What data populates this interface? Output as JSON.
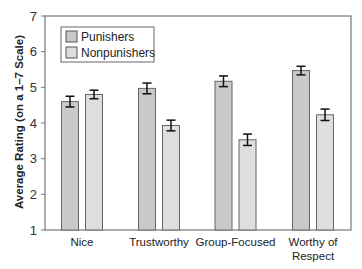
{
  "chart_data": {
    "type": "bar",
    "title": "",
    "xlabel": "",
    "ylabel": "Average Rating (on a 1–7 Scale)",
    "ylim": [
      1,
      7
    ],
    "yticks": [
      1,
      2,
      3,
      4,
      5,
      6,
      7
    ],
    "grid": false,
    "legend_position": "upper-left",
    "categories": [
      "Nice",
      "Trustworthy",
      "Group-Focused",
      "Worthy of Respect"
    ],
    "category_lines": [
      [
        "Nice"
      ],
      [
        "Trustworthy"
      ],
      [
        "Group-Focused"
      ],
      [
        "Worthy of",
        "Respect"
      ]
    ],
    "series": [
      {
        "name": "Punishers",
        "color": "#c9c9c9",
        "values": [
          4.6,
          4.97,
          5.17,
          5.47
        ],
        "errors": [
          0.15,
          0.15,
          0.15,
          0.12
        ]
      },
      {
        "name": "Nonpunishers",
        "color": "#dedede",
        "values": [
          4.8,
          3.93,
          3.53,
          4.23
        ],
        "errors": [
          0.12,
          0.15,
          0.16,
          0.16
        ]
      }
    ]
  }
}
